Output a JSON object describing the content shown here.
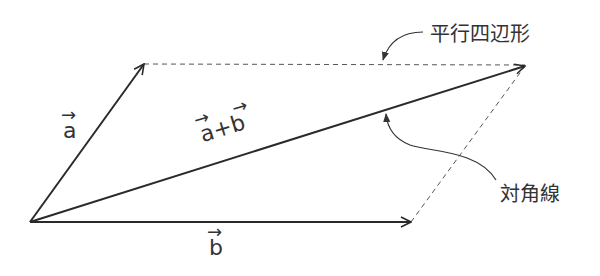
{
  "diagram": {
    "labels": {
      "vector_a": "a",
      "vector_b": "b",
      "sum": "a+b",
      "parallelogram": "平行四辺形",
      "diagonal": "対角線"
    },
    "points": {
      "origin": [
        30,
        222
      ],
      "a_tip": [
        144,
        64
      ],
      "b_tip": [
        411,
        222
      ],
      "sum_tip": [
        525,
        66
      ]
    },
    "colors": {
      "line": "#2a2a2a",
      "dashed": "#555555",
      "text": "#333333"
    }
  }
}
